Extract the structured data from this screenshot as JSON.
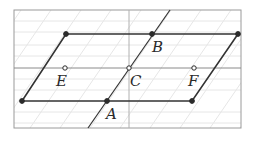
{
  "diagram": {
    "type": "geometry-parallelogram",
    "canvas": {
      "width": 255,
      "height": 143
    },
    "frame": {
      "x1": 14,
      "y1": 10,
      "x2": 241,
      "y2": 128,
      "color": "#9a9a9a"
    },
    "axes": {
      "horizontal": {
        "y": 68,
        "color": "#8a8a8a"
      },
      "vertical": {
        "x": 129,
        "color": "#b0b0b0"
      }
    },
    "grid": {
      "horizontal_ys": [
        21,
        32,
        45,
        56,
        79,
        90,
        112,
        123
      ],
      "diagonal_offsets": [
        -60,
        -30,
        0,
        30,
        60,
        90,
        120,
        150,
        180,
        210,
        240
      ],
      "color": "#e6e6e6"
    },
    "colors": {
      "line": "#333333",
      "point": "#2b2b2b",
      "label": "#2a2a2a"
    },
    "parallelogram": {
      "vertices": [
        {
          "x": 66,
          "y": 34
        },
        {
          "x": 238,
          "y": 34
        },
        {
          "x": 192,
          "y": 101
        },
        {
          "x": 22,
          "y": 101
        }
      ]
    },
    "transversal": {
      "x1": 88,
      "y1": 128,
      "x2": 170,
      "y2": 10
    },
    "points": [
      {
        "name": "B",
        "x": 152,
        "y": 34,
        "style": "filled",
        "label": "B",
        "lx": 152,
        "ly": 52
      },
      {
        "name": "A",
        "x": 107,
        "y": 101,
        "style": "filled",
        "label": "A",
        "lx": 106,
        "ly": 119
      },
      {
        "name": "C",
        "x": 129,
        "y": 68,
        "style": "open",
        "label": "C",
        "lx": 130,
        "ly": 86
      },
      {
        "name": "E",
        "x": 65,
        "y": 68,
        "style": "open",
        "label": "E",
        "lx": 56,
        "ly": 86
      },
      {
        "name": "F",
        "x": 194,
        "y": 68,
        "style": "open",
        "label": "F",
        "lx": 188,
        "ly": 86
      },
      {
        "name": "P1",
        "x": 66,
        "y": 34,
        "style": "filled",
        "label": ""
      },
      {
        "name": "P2",
        "x": 238,
        "y": 34,
        "style": "filled",
        "label": ""
      },
      {
        "name": "P3",
        "x": 22,
        "y": 101,
        "style": "filled",
        "label": ""
      },
      {
        "name": "P4",
        "x": 192,
        "y": 101,
        "style": "filled",
        "label": ""
      }
    ],
    "labels": {
      "A": "A",
      "B": "B",
      "C": "C",
      "E": "E",
      "F": "F"
    }
  }
}
